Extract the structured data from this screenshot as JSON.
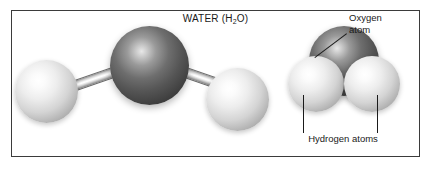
{
  "figure": {
    "title_main": "WATER (H",
    "title_sub": "2",
    "title_tail": "O)",
    "title_full": "WATER (H2O)",
    "background_color": "#ffffff",
    "frame_color": "#3b3b3b",
    "text_color": "#1a1a1a"
  },
  "labels": {
    "oxygen_line1": "Oxygen",
    "oxygen_line2": "atom",
    "hydrogen": "Hydrogen atoms"
  },
  "models": {
    "ball_and_stick": {
      "name": "ball-and-stick-model",
      "atoms": [
        {
          "element": "H",
          "name": "hydrogen-left",
          "color": "#e8e8e8"
        },
        {
          "element": "O",
          "name": "oxygen-center",
          "color": "#4a4a4a"
        },
        {
          "element": "H",
          "name": "hydrogen-right",
          "color": "#e8e8e8"
        }
      ],
      "bonds": 2,
      "bond_color": "#d8d8d8"
    },
    "space_filling": {
      "name": "space-filling-model",
      "atoms": [
        {
          "element": "O",
          "name": "oxygen-top",
          "color": "#4a4a4a"
        },
        {
          "element": "H",
          "name": "hydrogen-lower-left",
          "color": "#e8e8e8"
        },
        {
          "element": "H",
          "name": "hydrogen-lower-right",
          "color": "#e8e8e8"
        }
      ]
    }
  }
}
